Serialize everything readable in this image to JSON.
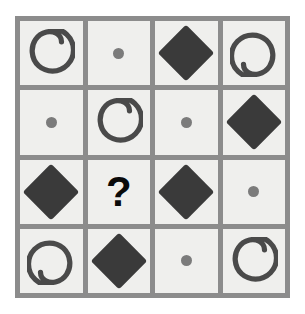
{
  "puzzle": {
    "type": "pattern-matrix",
    "rows": 4,
    "columns": 4,
    "missing_cell": {
      "row": 3,
      "column": 2
    },
    "missing_marker": "?",
    "colors": {
      "page_background": "#ffffff",
      "grid_line": "#8c8c8c",
      "cell_background": "#efefed",
      "diamond_fill": "#3a3a3a",
      "dot_fill": "#7b7b7b",
      "spiral_stroke": "#4a4a4a",
      "question_mark": "#0a0a0a"
    },
    "symbol_legend": {
      "spiral-a": "spiral with tail opening toward upper-left",
      "spiral-b": "spiral with tail opening toward upper-right (rotated 180 degrees)",
      "diamond": "solid dark diamond",
      "dot": "small gray circle",
      "question": "bold black question mark"
    },
    "cells": [
      {
        "id": "r1c1",
        "row": 1,
        "column": 1,
        "symbol": "spiral-a",
        "label": "spiral"
      },
      {
        "id": "r1c2",
        "row": 1,
        "column": 2,
        "symbol": "dot",
        "label": "dot"
      },
      {
        "id": "r1c3",
        "row": 1,
        "column": 3,
        "symbol": "diamond",
        "label": "diamond"
      },
      {
        "id": "r1c4",
        "row": 1,
        "column": 4,
        "symbol": "spiral-b",
        "label": "spiral"
      },
      {
        "id": "r2c1",
        "row": 2,
        "column": 1,
        "symbol": "dot",
        "label": "dot"
      },
      {
        "id": "r2c2",
        "row": 2,
        "column": 2,
        "symbol": "spiral-a",
        "label": "spiral"
      },
      {
        "id": "r2c3",
        "row": 2,
        "column": 3,
        "symbol": "dot",
        "label": "dot"
      },
      {
        "id": "r2c4",
        "row": 2,
        "column": 4,
        "symbol": "diamond",
        "label": "diamond"
      },
      {
        "id": "r3c1",
        "row": 3,
        "column": 1,
        "symbol": "diamond",
        "label": "diamond"
      },
      {
        "id": "r3c2",
        "row": 3,
        "column": 2,
        "symbol": "question",
        "label": "?"
      },
      {
        "id": "r3c3",
        "row": 3,
        "column": 3,
        "symbol": "diamond",
        "label": "diamond"
      },
      {
        "id": "r3c4",
        "row": 3,
        "column": 4,
        "symbol": "dot",
        "label": "dot"
      },
      {
        "id": "r4c1",
        "row": 4,
        "column": 1,
        "symbol": "spiral-b",
        "label": "spiral"
      },
      {
        "id": "r4c2",
        "row": 4,
        "column": 2,
        "symbol": "diamond",
        "label": "diamond"
      },
      {
        "id": "r4c3",
        "row": 4,
        "column": 3,
        "symbol": "dot",
        "label": "dot"
      },
      {
        "id": "r4c4",
        "row": 4,
        "column": 4,
        "symbol": "spiral-a",
        "label": "spiral"
      }
    ]
  }
}
